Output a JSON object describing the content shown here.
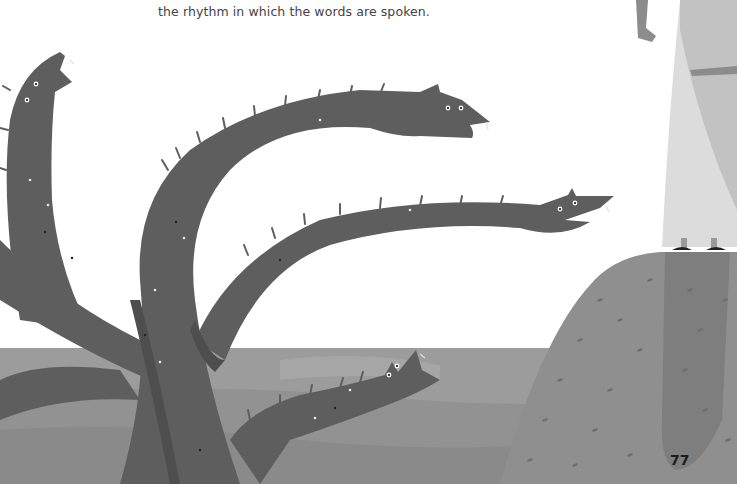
{
  "page": {
    "caption": "the rhythm in which the words are spoken.",
    "page_number": "77"
  },
  "illustration": {
    "subject": "multi-headed hydra facing a robed figure standing on a rock",
    "elements": [
      "hydra",
      "hydra-head-top-left",
      "hydra-head-upper",
      "hydra-head-middle",
      "hydra-head-lower",
      "robed-figure",
      "rock",
      "water"
    ],
    "colors": {
      "background": "#ffffff",
      "hydra_body": "#5e5e5e",
      "hydra_shadow": "#4e4e4e",
      "water_light": "#9c9c9c",
      "water_dark": "#8a8a8a",
      "rock": "#8f8f8f",
      "rock_shadow": "#7e7e7e",
      "robe": "#dcdcdc",
      "robe_shadow": "#c2c2c2",
      "arm": "#8c8c8c",
      "text": "#444444"
    }
  }
}
